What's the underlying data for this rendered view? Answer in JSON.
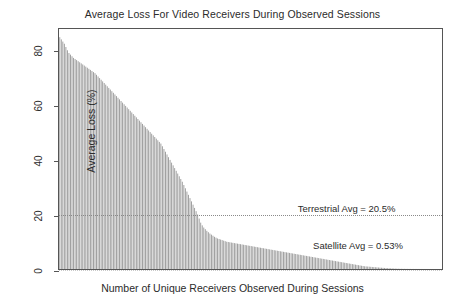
{
  "chart_data": {
    "type": "bar",
    "title": "Average Loss For Video Receivers During Observed Sessions",
    "xlabel": "Number of Unique Receivers Observed During Sessions",
    "ylabel": "Average Loss (%)",
    "ylim": [
      0,
      88
    ],
    "xlim": [
      0,
      132
    ],
    "grid": false,
    "legend": null,
    "bar_color": "#9c9c9c",
    "frame_color": "#555555",
    "yticks": [
      0,
      20,
      40,
      60,
      80
    ],
    "ytick_labels": [
      "0",
      "20",
      "40",
      "60",
      "80"
    ],
    "xticks": [],
    "xtick_labels": [],
    "annotations": [
      {
        "name": "terrestrial-average",
        "text": "Terrestrial Avg = 20.5%",
        "value": 20.5,
        "line_style": "dotted",
        "x_frac": 0.62,
        "label_dy": -12
      },
      {
        "name": "satellite-average",
        "text": "Satellite Avg = 0.53%",
        "value": 0.53,
        "line_style": "dotted",
        "x_frac": 0.66,
        "label_dy": -30
      }
    ],
    "series_name": "Average loss per receiver (sorted descending)",
    "values": [
      85.0,
      84.2,
      83.4,
      82.6,
      81.4,
      80.2,
      79.2,
      78.6,
      78.0,
      77.4,
      77.0,
      76.6,
      76.2,
      75.8,
      75.4,
      75.0,
      74.6,
      74.2,
      73.8,
      73.4,
      73.0,
      72.6,
      72.2,
      71.8,
      71.2,
      70.6,
      70.0,
      69.4,
      68.8,
      68.2,
      67.6,
      67.0,
      66.4,
      65.8,
      65.2,
      64.6,
      64.0,
      63.4,
      62.8,
      62.2,
      61.6,
      61.0,
      60.4,
      59.8,
      59.2,
      58.6,
      58.0,
      57.4,
      56.8,
      56.2,
      55.6,
      55.0,
      54.4,
      53.8,
      53.2,
      52.6,
      52.0,
      51.4,
      50.8,
      50.2,
      49.6,
      49.0,
      48.4,
      47.8,
      47.2,
      46.6,
      46.0,
      45.0,
      44.0,
      43.0,
      42.0,
      41.0,
      40.0,
      39.0,
      38.0,
      37.0,
      36.0,
      35.0,
      34.0,
      33.0,
      32.0,
      30.8,
      29.6,
      28.4,
      27.2,
      26.0,
      24.8,
      23.6,
      22.4,
      21.2,
      20.0,
      18.5,
      17.0,
      16.0,
      15.2,
      14.6,
      14.0,
      13.5,
      13.0,
      12.6,
      12.2,
      11.8,
      11.5,
      11.2,
      11.0,
      10.8,
      10.6,
      10.4,
      10.2,
      10.0,
      9.9,
      9.8,
      9.7,
      9.6,
      9.5,
      9.4,
      9.3,
      9.2,
      9.1,
      9.0,
      8.9,
      8.8,
      8.7,
      8.6,
      8.5,
      8.4,
      8.3,
      8.2,
      8.1,
      8.0,
      7.9,
      7.8,
      7.7,
      7.6,
      7.5,
      7.4,
      7.3,
      7.2,
      7.1,
      7.0,
      6.9,
      6.8,
      6.7,
      6.6,
      6.5,
      6.4,
      6.3,
      6.2,
      6.1,
      6.0,
      5.9,
      5.8,
      5.7,
      5.6,
      5.5,
      5.4,
      5.3,
      5.2,
      5.1,
      5.0,
      4.9,
      4.8,
      4.7,
      4.6,
      4.5,
      4.4,
      4.3,
      4.2,
      4.1,
      4.0,
      3.9,
      3.8,
      3.7,
      3.6,
      3.5,
      3.4,
      3.3,
      3.2,
      3.1,
      3.0,
      2.9,
      2.8,
      2.7,
      2.6,
      2.5,
      2.4,
      2.3,
      2.2,
      2.1,
      2.0,
      1.9,
      1.8,
      1.7,
      1.6,
      1.5,
      1.4,
      1.3,
      1.2,
      1.1,
      1.0,
      0.95,
      0.9,
      0.85,
      0.8,
      0.75,
      0.7,
      0.65,
      0.6,
      0.55,
      0.5,
      0.46,
      0.42,
      0.38,
      0.34,
      0.3,
      0.27,
      0.24,
      0.21,
      0.18,
      0.15,
      0.13,
      0.11,
      0.09,
      0.08,
      0.07,
      0.06,
      0.05,
      0.045,
      0.04,
      0.035,
      0.03,
      0.028,
      0.025,
      0.022,
      0.02,
      0.018,
      0.016,
      0.014,
      0.012,
      0.01,
      0.009,
      0.008,
      0.007,
      0.006,
      0.005,
      0.004,
      0.003,
      0.002,
      0.001,
      0.0
    ]
  }
}
